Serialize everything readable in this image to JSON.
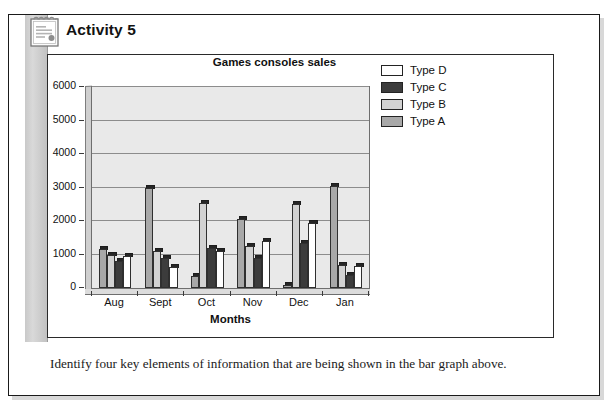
{
  "activity": {
    "title": "Activity 5",
    "icon": "notepad-icon",
    "caption": "Identify four key elements of information that are being shown in the bar graph above."
  },
  "chart_data": {
    "type": "bar",
    "title": "Games consoles sales",
    "xlabel": "Months",
    "ylabel": "",
    "categories": [
      "Aug",
      "Sept",
      "Oct",
      "Nov",
      "Dec",
      "Jan"
    ],
    "ylim": [
      0,
      6000
    ],
    "yticks": [
      0,
      1000,
      2000,
      3000,
      4000,
      5000,
      6000
    ],
    "ytick_labels": [
      "0",
      "1000",
      "2000",
      "3000",
      "4000",
      "5000",
      "6000"
    ],
    "grid": true,
    "legend_position": "right",
    "series": [
      {
        "name": "Type A",
        "color": "#a8a8a8",
        "values": [
          1150,
          3000,
          350,
          2050,
          80,
          3050
        ]
      },
      {
        "name": "Type B",
        "color": "#d2d2d2",
        "values": [
          1000,
          1100,
          2550,
          1250,
          2500,
          700
        ]
      },
      {
        "name": "Type C",
        "color": "#3c3c3c",
        "values": [
          820,
          900,
          1200,
          900,
          1350,
          400
        ]
      },
      {
        "name": "Type D",
        "color": "#ffffff",
        "values": [
          950,
          620,
          1100,
          1400,
          1950,
          650
        ]
      }
    ]
  },
  "legend": {
    "items": [
      {
        "label": "Type D",
        "color": "#ffffff"
      },
      {
        "label": "Type C",
        "color": "#3c3c3c"
      },
      {
        "label": "Type B",
        "color": "#d2d2d2"
      },
      {
        "label": "Type A",
        "color": "#a8a8a8"
      }
    ]
  },
  "colors": {
    "plot_background": "#e9e9e9",
    "gridline": "#8c8c8c",
    "bar_outline": "#2f2f2f",
    "bar_top_cap": "#262626",
    "page_border": "#1a1a1a",
    "left_bar": "#cfcfcf"
  }
}
